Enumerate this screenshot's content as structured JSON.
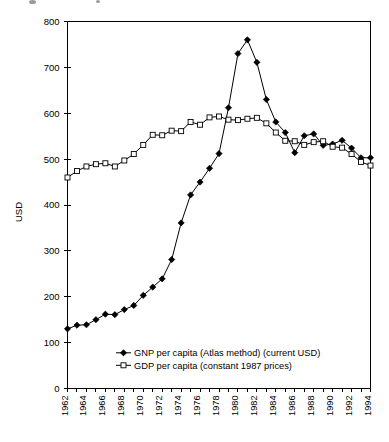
{
  "chart_data": {
    "type": "line",
    "title": "",
    "xlabel": "",
    "ylabel": "USD",
    "ylim": [
      0,
      800
    ],
    "ytick_step": 100,
    "yticks": [
      "0",
      "100",
      "200",
      "300",
      "400",
      "500",
      "600",
      "700",
      "800"
    ],
    "xlim": [
      1962,
      1994
    ],
    "x": [
      1962,
      1963,
      1964,
      1965,
      1966,
      1967,
      1968,
      1969,
      1970,
      1971,
      1972,
      1973,
      1974,
      1975,
      1976,
      1977,
      1978,
      1979,
      1980,
      1981,
      1982,
      1983,
      1984,
      1985,
      1986,
      1987,
      1988,
      1989,
      1990,
      1991,
      1992,
      1993,
      1994
    ],
    "xtick_labels": [
      "1962",
      "1964",
      "1966",
      "1968",
      "1970",
      "1972",
      "1974",
      "1976",
      "1978",
      "1980",
      "1982",
      "1984",
      "1986",
      "1988",
      "1990",
      "1992",
      "1994"
    ],
    "xtick_label_step": 2,
    "xtick_minor_step": 1,
    "grid": false,
    "legend_position": "inside-bottom-center",
    "series": [
      {
        "name": "GNP per capita (Atlas method) (current USD)",
        "marker": "filled-diamond",
        "color": "#000000",
        "values": [
          130,
          138,
          139,
          150,
          162,
          161,
          172,
          181,
          203,
          221,
          239,
          281,
          361,
          422,
          450,
          480,
          512,
          612,
          730,
          760,
          711,
          630,
          581,
          558,
          514,
          551,
          555,
          530,
          533,
          541,
          524,
          503,
          503
        ]
      },
      {
        "name": "GDP per capita (constant 1987 prices)",
        "marker": "open-square",
        "color": "#000000",
        "values": [
          460,
          474,
          484,
          489,
          491,
          484,
          497,
          511,
          531,
          553,
          552,
          562,
          561,
          581,
          575,
          591,
          593,
          586,
          585,
          588,
          590,
          578,
          558,
          540,
          539,
          531,
          537,
          539,
          527,
          525,
          511,
          494,
          486
        ]
      }
    ]
  },
  "axis": {
    "y_title": "USD"
  },
  "legend": {
    "items": [
      {
        "label": "GNP per capita (Atlas method) (current USD)",
        "marker": "filled-diamond"
      },
      {
        "label": "GDP per capita (constant 1987 prices)",
        "marker": "open-square"
      }
    ]
  }
}
